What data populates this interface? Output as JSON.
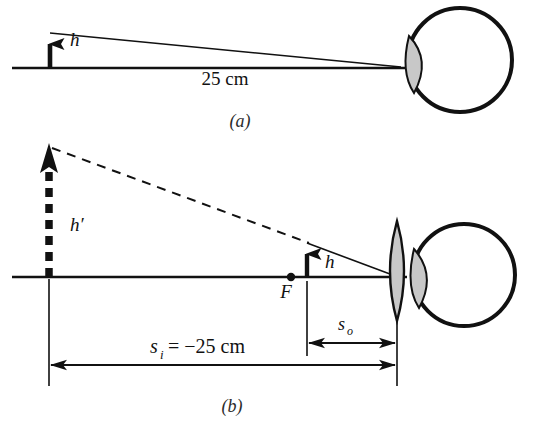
{
  "figure": {
    "background_color": "#ffffff",
    "stroke_color": "#111111",
    "shade_color": "#c8c8c8",
    "width": 537,
    "height": 428
  },
  "panels": [
    {
      "id": "a",
      "caption": "(a)",
      "caption_x": 240,
      "caption_y": 127,
      "description": "Object of height h viewed by unaided eye at the near point, 25 cm away.",
      "labels": [
        {
          "name": "object-height-label",
          "text": "h",
          "x": 70,
          "y": 46,
          "style": "italic"
        },
        {
          "name": "near-point-distance-label",
          "text": "25 cm",
          "x": 225,
          "y": 85,
          "style": "plain"
        }
      ]
    },
    {
      "id": "b",
      "caption": "(b)",
      "caption_x": 232,
      "caption_y": 412,
      "description": "Object of height h inside the focal point F of a converging lens forms an enlarged virtual image of height h' at the near point.",
      "labels": [
        {
          "name": "image-height-label",
          "text": "h′",
          "x": 70,
          "y": 231,
          "style": "italic"
        },
        {
          "name": "object-height-label",
          "text": "h",
          "x": 325,
          "y": 268,
          "style": "italic"
        },
        {
          "name": "focal-point-label",
          "text": "F",
          "x": 286,
          "y": 297,
          "style": "italic"
        },
        {
          "name": "object-distance-label",
          "text": "s",
          "sub": "o",
          "x": 344,
          "y": 330,
          "style": "italic"
        },
        {
          "name": "image-distance-label",
          "text": "s",
          "sub": "i",
          "suffix": " = −25 cm",
          "x": 163,
          "y": 353,
          "style": "italic"
        }
      ]
    }
  ],
  "geometry": {
    "panel_a": {
      "axis": {
        "x1": 12,
        "y1": 68,
        "x2": 455,
        "y2": 68
      },
      "object_arrow": {
        "x": 50,
        "y_base": 68,
        "y_tip": 33
      },
      "ray_top": {
        "x1": 50,
        "y1": 33,
        "x2": 399,
        "y2": 68
      },
      "eye": {
        "cx": 460,
        "cy": 60,
        "r": 52,
        "cornea_side": "left"
      }
    },
    "panel_b": {
      "axis": {
        "x1": 12,
        "y1": 277,
        "x2": 410,
        "y2": 277
      },
      "image_arrow": {
        "x": 49,
        "y_base": 277,
        "y_tip": 148,
        "dashed": true
      },
      "object_arrow": {
        "x": 307,
        "y_base": 277,
        "y_tip": 243
      },
      "ray_solid": {
        "x1": 307,
        "y1": 243,
        "x2": 397,
        "y2": 277
      },
      "ray_dashed": {
        "x1": 49,
        "y1": 148,
        "x2": 307,
        "y2": 243
      },
      "focal_point": {
        "x": 291,
        "y": 277,
        "r": 4
      },
      "lens": {
        "cx": 397,
        "cy": 271,
        "half_height": 50,
        "half_width": 12
      },
      "eye": {
        "cx": 464,
        "cy": 275,
        "r": 52,
        "cornea_side": "left"
      },
      "dimension_so": {
        "x1": 307,
        "x2": 397,
        "y": 343
      },
      "dimension_si": {
        "x1": 49,
        "x2": 397,
        "y": 365
      },
      "extension_lines": [
        {
          "x": 49,
          "y1": 277,
          "y2": 385
        },
        {
          "x": 307,
          "y1": 281,
          "y2": 355
        },
        {
          "x": 397,
          "y1": 322,
          "y2": 385
        }
      ]
    }
  }
}
